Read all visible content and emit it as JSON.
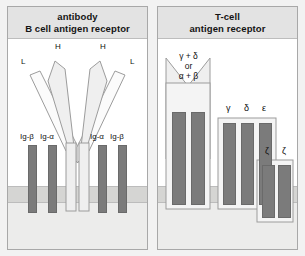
{
  "figure": {
    "background_color": "#f2f2f2",
    "panel_border_color": "#a8a8a8",
    "membrane_color": "#d5d5d3",
    "cytoplasm_color": "#ececeb",
    "chain_bar_color": "#7b7b7b",
    "protein_body_color": "#f4f4f4"
  },
  "left_panel": {
    "header_line1": "antibody",
    "header_line2": "B cell antigen receptor",
    "chain_labels": {
      "heavy_left": "H",
      "heavy_right": "H",
      "light_left": "L",
      "light_right": "L"
    },
    "accessory_labels": [
      "Ig-β",
      "Ig-α",
      "Ig-α",
      "Ig-β"
    ]
  },
  "right_panel": {
    "header_line1": "T-cell",
    "header_line2": "antigen receptor",
    "receptor_label_line1": "γ + δ",
    "receptor_label_line2": "or",
    "receptor_label_line3": "α + β",
    "cd3_labels": [
      "γ",
      "δ",
      "ε"
    ],
    "zeta_labels": [
      "ζ",
      "ζ"
    ]
  }
}
